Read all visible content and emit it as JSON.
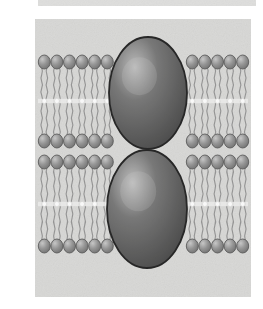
{
  "figure": {
    "caption": "",
    "type": "scientific-illustration",
    "canvas": {
      "width": 263,
      "height": 309,
      "background": "#ffffff"
    },
    "panel": {
      "x": 35,
      "y": 19,
      "width": 216,
      "height": 278,
      "fill": "#d9d9d7",
      "texture": "mottled-paper-grain"
    },
    "top_strip": {
      "x": 38,
      "y": 0,
      "width": 218,
      "height": 6,
      "fill": "#d3d3d1",
      "note": "cropped edge of adjacent figure above"
    },
    "colors": {
      "page_background": "#ffffff",
      "panel_fill": "#d9d9d7",
      "head_fill": "#8f8f8f",
      "head_highlight": "#c6c6c6",
      "head_outline": "#4a4a4a",
      "tail_stroke": "#8a8a8a",
      "midline": "#efefed",
      "midline_dot": "#ffffff",
      "protein_dark": "#4a4a4a",
      "protein_mid": "#6e6e6e",
      "protein_light": "#b8b8b8",
      "protein_outline": "#161616"
    },
    "bilayers": [
      {
        "name": "upper-bilayer",
        "top_heads_y": 55,
        "bottom_heads_y": 241,
        "top": 55,
        "bottom": 148,
        "midline_y": 101,
        "leaflets": 2
      },
      {
        "name": "lower-bilayer",
        "top": 155,
        "bottom": 253,
        "midline_y": 204,
        "leaflets": 2
      }
    ],
    "lipid": {
      "head_width": 12,
      "head_height": 14,
      "spacing": 12.6,
      "tail_count": 2,
      "tail_waves": 5,
      "head_shape": "ellipse",
      "tail_shape": "wavy-line"
    },
    "proteins": [
      {
        "name": "upper-protein",
        "shape": "ellipse",
        "cx": 148,
        "cy": 93,
        "rx": 39,
        "ry": 56,
        "fill_light": "#b8b8b8",
        "fill_dark": "#3f3f3f",
        "outline": "#141414",
        "highlight_x": 33,
        "highlight_y": 27
      },
      {
        "name": "lower-protein",
        "shape": "ellipse",
        "cx": 147,
        "cy": 209,
        "rx": 40,
        "ry": 59,
        "fill_light": "#bcbcbc",
        "fill_dark": "#3f3f3f",
        "outline": "#141414",
        "highlight_x": 32,
        "highlight_y": 28
      }
    ],
    "labels": []
  }
}
